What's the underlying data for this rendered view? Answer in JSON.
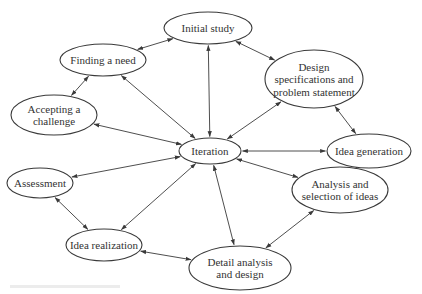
{
  "diagram": {
    "title": "",
    "colors": {
      "stroke": "#3a3a3a",
      "text": "#333333",
      "background": "#ffffff"
    },
    "nodes": [
      {
        "id": "initial-study",
        "lines": [
          "Initial study"
        ],
        "cx": 208,
        "cy": 28,
        "rx": 44,
        "ry": 16
      },
      {
        "id": "finding-a-need",
        "lines": [
          "Finding a need"
        ],
        "cx": 103,
        "cy": 60,
        "rx": 43,
        "ry": 16
      },
      {
        "id": "design-specifications",
        "lines": [
          "Design",
          "specifications and",
          "problem statement"
        ],
        "cx": 314,
        "cy": 79,
        "rx": 49,
        "ry": 29
      },
      {
        "id": "accepting-a-challenge",
        "lines": [
          "Accepting a",
          "challenge"
        ],
        "cx": 54,
        "cy": 115,
        "rx": 43,
        "ry": 20
      },
      {
        "id": "iteration",
        "lines": [
          "Iteration"
        ],
        "cx": 210,
        "cy": 151,
        "rx": 31,
        "ry": 13
      },
      {
        "id": "idea-generation",
        "lines": [
          "Idea generation"
        ],
        "cx": 369,
        "cy": 151,
        "rx": 42,
        "ry": 17
      },
      {
        "id": "assessment",
        "lines": [
          "Assessment"
        ],
        "cx": 40,
        "cy": 183,
        "rx": 33,
        "ry": 15
      },
      {
        "id": "analysis-and-selection",
        "lines": [
          "Analysis and",
          "selection of ideas"
        ],
        "cx": 340,
        "cy": 190,
        "rx": 48,
        "ry": 23
      },
      {
        "id": "idea-realization",
        "lines": [
          "Idea realization"
        ],
        "cx": 104,
        "cy": 245,
        "rx": 38,
        "ry": 16
      },
      {
        "id": "detail-analysis",
        "lines": [
          "Detail analysis",
          "and design"
        ],
        "cx": 240,
        "cy": 268,
        "rx": 51,
        "ry": 22
      }
    ],
    "edges": [
      {
        "from": "finding-a-need",
        "to": "initial-study",
        "bidirectional": true
      },
      {
        "from": "initial-study",
        "to": "design-specifications",
        "bidirectional": true
      },
      {
        "from": "finding-a-need",
        "to": "accepting-a-challenge",
        "bidirectional": true
      },
      {
        "from": "design-specifications",
        "to": "idea-generation",
        "bidirectional": true
      },
      {
        "from": "idea-generation",
        "to": "analysis-and-selection",
        "bidirectional": true
      },
      {
        "from": "analysis-and-selection",
        "to": "detail-analysis",
        "bidirectional": true
      },
      {
        "from": "detail-analysis",
        "to": "idea-realization",
        "bidirectional": true
      },
      {
        "from": "idea-realization",
        "to": "assessment",
        "bidirectional": true
      },
      {
        "from": "iteration",
        "to": "initial-study",
        "bidirectional": true
      },
      {
        "from": "iteration",
        "to": "finding-a-need",
        "bidirectional": true
      },
      {
        "from": "iteration",
        "to": "design-specifications",
        "bidirectional": true
      },
      {
        "from": "iteration",
        "to": "accepting-a-challenge",
        "bidirectional": true
      },
      {
        "from": "iteration",
        "to": "idea-generation",
        "bidirectional": true
      },
      {
        "from": "iteration",
        "to": "assessment",
        "bidirectional": true
      },
      {
        "from": "iteration",
        "to": "analysis-and-selection",
        "bidirectional": true
      },
      {
        "from": "iteration",
        "to": "idea-realization",
        "bidirectional": true
      },
      {
        "from": "iteration",
        "to": "detail-analysis",
        "bidirectional": true
      }
    ]
  }
}
